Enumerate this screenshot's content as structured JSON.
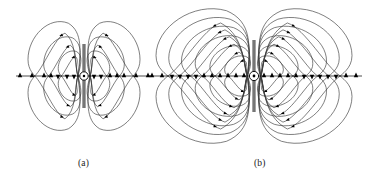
{
  "figure": {
    "kind": "diagram",
    "title_visible": false,
    "background_color": "#ffffff",
    "line_color": "#3a3a3a",
    "arrow_color": "#000000",
    "antenna_color": "#000000",
    "panels": [
      {
        "id": "a",
        "caption": "(a)",
        "caption_x": 78,
        "caption_y": 158,
        "center_x": 84,
        "center_y": 76,
        "antenna_half_length": 32,
        "feed_circle_radius": 4.2,
        "loops_per_quadrant": 3,
        "loop_scales": [
          0.46,
          0.72,
          1.0
        ],
        "outer_half_width": 56,
        "outer_half_height": 55,
        "axis_x_start": 16,
        "axis_x_end": 152,
        "axis_arrow_offsets": [
          -64,
          -52,
          -40,
          -33,
          -26,
          -17,
          -10,
          10,
          17,
          26,
          33,
          40,
          52,
          64
        ],
        "axis_arrow_directions": [
          "up",
          "up",
          "up",
          "up",
          "down",
          "down",
          "down",
          "down",
          "down",
          "up",
          "up",
          "up",
          "up",
          "up"
        ]
      },
      {
        "id": "b",
        "caption": "(b)",
        "caption_x": 254,
        "caption_y": 158,
        "center_x": 254,
        "center_y": 76,
        "antenna_half_length": 36,
        "feed_circle_radius": 4.6,
        "loops_per_quadrant": 6,
        "loop_scales": [
          0.3,
          0.45,
          0.6,
          0.74,
          0.87,
          1.0
        ],
        "outer_half_width": 98,
        "outer_half_height": 68,
        "axis_x_start": 148,
        "axis_x_end": 362,
        "axis_arrow_offsets": [
          -102,
          -92,
          -82,
          -74,
          -66,
          -58,
          -50,
          -42,
          -34,
          -26,
          -18,
          -10,
          10,
          18,
          26,
          34,
          42,
          50,
          58,
          66,
          74,
          82,
          92,
          102
        ],
        "axis_arrow_directions": [
          "up",
          "up",
          "down",
          "down",
          "down",
          "down",
          "up",
          "up",
          "up",
          "up",
          "up",
          "up",
          "up",
          "up",
          "up",
          "up",
          "up",
          "down",
          "down",
          "down",
          "down",
          "down",
          "up",
          "up"
        ]
      }
    ]
  },
  "chart_data": {
    "type": "diagram",
    "panel_labels": [
      "(a)",
      "(b)"
    ],
    "description_a": "Electric field lines of a short dipole antenna: three nested closed loops in each of the four quadrants, a vertical antenna element with a feed circle at the origin, and a horizontal axis with triangular arrowheads.",
    "description_b": "Electric field lines of a longer dipole antenna: six nested closed loops in each quadrant spreading wider, vertical antenna element with feed circle, and a horizontal axis with triangular arrowheads.",
    "loops_a": 3,
    "loops_b": 6,
    "axis_arrowheads_a": 14,
    "axis_arrowheads_b": 24
  }
}
